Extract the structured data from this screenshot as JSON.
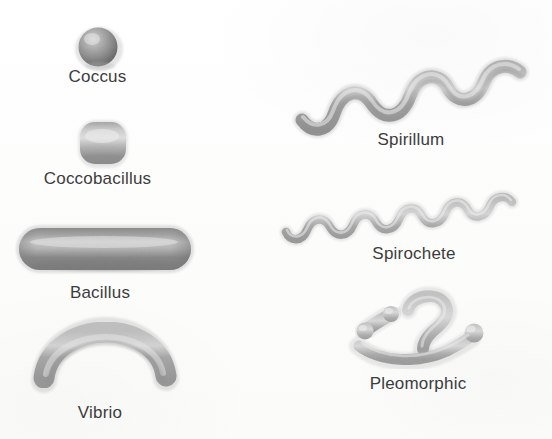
{
  "figure": {
    "background_color": "#fdfdfd",
    "ink_color": "#8a8a8a",
    "label_color": "#3c3c3c"
  },
  "organisms": [
    {
      "id": "coccus",
      "label": "Coccus",
      "shape": "sphere",
      "column": "left",
      "order": 1,
      "label_x": 97,
      "label_y": 76,
      "shape_cx": 97,
      "shape_cy": 47,
      "shape_rx": 19,
      "shape_ry": 19
    },
    {
      "id": "coccobacillus",
      "label": "Coccobacillus",
      "shape": "rounded-square",
      "column": "left",
      "order": 2,
      "label_x": 97,
      "label_y": 178,
      "shape_cx": 102,
      "shape_cy": 143,
      "shape_rx": 23,
      "shape_ry": 21
    },
    {
      "id": "bacillus",
      "label": "Bacillus",
      "shape": "rod",
      "column": "left",
      "order": 3,
      "label_x": 101,
      "label_y": 292,
      "shape_cx": 102,
      "shape_cy": 248,
      "shape_rx": 84,
      "shape_ry": 21
    },
    {
      "id": "vibrio",
      "label": "Vibrio",
      "shape": "curved-rod",
      "column": "left",
      "order": 4,
      "label_x": 101,
      "label_y": 412,
      "shape_cx": 102,
      "shape_cy": 355,
      "shape_rx": 62,
      "shape_ry": 26
    },
    {
      "id": "spirillum",
      "label": "Spirillum",
      "shape": "thick-spiral",
      "column": "right",
      "order": 1,
      "label_x": 411,
      "label_y": 139,
      "shape_cx": 410,
      "shape_cy": 95,
      "shape_rx": 113,
      "shape_ry": 30,
      "wave_cycles": 3
    },
    {
      "id": "spirochete",
      "label": "Spirochete",
      "shape": "thin-spiral",
      "column": "right",
      "order": 2,
      "label_x": 413,
      "label_y": 253,
      "shape_cx": 408,
      "shape_cy": 212,
      "shape_rx": 124,
      "shape_ry": 22,
      "wave_cycles": 6
    },
    {
      "id": "pleomorphic",
      "label": "Pleomorphic",
      "shape": "irregular-cluster",
      "column": "right",
      "order": 3,
      "label_x": 418,
      "label_y": 383,
      "shape_cx": 432,
      "shape_cy": 328,
      "shape_rx": 70,
      "shape_ry": 42,
      "parts": [
        "dumbbell",
        "hook",
        "club-rod"
      ]
    }
  ]
}
